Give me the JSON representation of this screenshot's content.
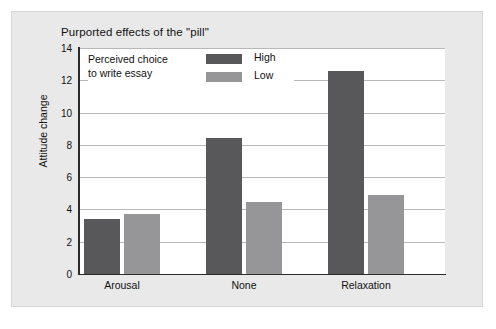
{
  "figure": {
    "title": "Purported effects of the \"pill\"",
    "panel_background": "#e9e9e9",
    "plot_background": "#ffffff"
  },
  "legend": {
    "title_line1": "Perceived choice",
    "title_line2": "to write essay",
    "entries": [
      {
        "label": "High",
        "color": "#58585a"
      },
      {
        "label": "Low",
        "color": "#969698"
      }
    ]
  },
  "axes": {
    "y_title": "Attitude change",
    "y_ticks": [
      "0",
      "2",
      "4",
      "6",
      "8",
      "10",
      "12",
      "14"
    ],
    "x_categories": [
      "Arousal",
      "None",
      "Relaxation"
    ]
  },
  "chart_data": {
    "type": "bar",
    "title": "Purported effects of the \"pill\"",
    "xlabel": "",
    "ylabel": "Attitude change",
    "ylim": [
      0,
      14
    ],
    "ytick_step": 2,
    "grid": true,
    "legend_position": "inside-top-left",
    "legend_title": "Perceived choice to write essay",
    "categories": [
      "Arousal",
      "None",
      "Relaxation"
    ],
    "series": [
      {
        "name": "High",
        "color": "#58585a",
        "values": [
          3.4,
          8.4,
          12.55
        ]
      },
      {
        "name": "Low",
        "color": "#969698",
        "values": [
          3.7,
          4.45,
          4.9
        ]
      }
    ]
  },
  "geometry": {
    "plot": {
      "left": 78,
      "top": 48,
      "width": 367,
      "height": 226
    },
    "y_max": 14,
    "bar_width": 36,
    "group_centers": [
      122,
      244,
      366
    ],
    "bar_offsets": [
      -38,
      2
    ]
  }
}
